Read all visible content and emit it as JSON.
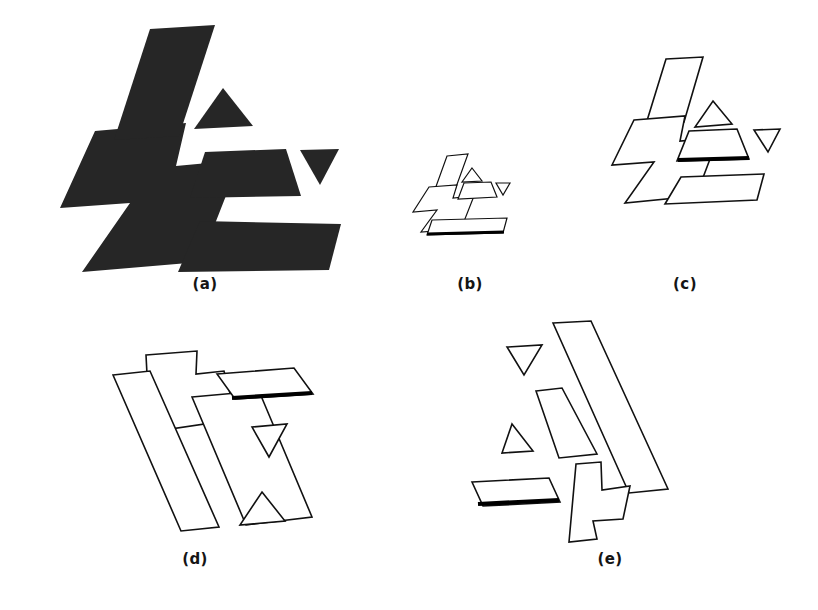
{
  "figure": {
    "background_color": "#ffffff",
    "silhouette_color": "#262626",
    "outline_color": "#111111",
    "emphasis_color": "#000000",
    "panel_count": 5
  },
  "captions": {
    "a": "(a)",
    "b": "(b)",
    "c": "(c)",
    "d": "(d)",
    "e": "(e)"
  },
  "panels": [
    {
      "id": "a",
      "label": "(a)",
      "kind": "filled-silhouette",
      "description": "Scene silhouette: large zigzag polygon, slanted bar, trapezoid, up triangle, down triangle",
      "part_count": 5
    },
    {
      "id": "b",
      "label": "(b)",
      "kind": "wireframe",
      "description": "Small scale model outline hypothesis with highlighted base edge",
      "part_count": 6
    },
    {
      "id": "c",
      "label": "(c)",
      "kind": "wireframe",
      "description": "Model outline hypothesis, upright pose, highlighted trapezoid base edge",
      "part_count": 6
    },
    {
      "id": "d",
      "label": "(d)",
      "kind": "wireframe",
      "description": "Model outline hypothesis, rotated pose, highlighted slanted bar base edge",
      "part_count": 6
    },
    {
      "id": "e",
      "label": "(e)",
      "kind": "wireframe",
      "description": "Model outline hypothesis, mirrored rotated pose, highlighted parallelogram base edge",
      "part_count": 6
    }
  ],
  "shapes": {
    "a": {
      "zigzag": "95,131 185,124 175,166 239,160 200,260 82,271 128,203 61,207",
      "slanted_bar": "150,30 214,26 178,135 113,139",
      "trapezoid": "205,152 285,149 300,196 190,197",
      "triangle_up": "222,89 252,125 194,128",
      "triangle_down": "300,152 338,151 319,184",
      "big_bottom": "199,221 340,225 328,269 178,271"
    },
    "b": {
      "zigzag": "428,188 456,186 452,199 473,197 460,228 422,231 436,209 414,211",
      "slanted_bar": "447,156 467,155 455,190 434,191",
      "trapezoid": "464,184 490,183 495,198 459,199",
      "triangle_up": "471,169 481,181 462,182",
      "triangle_down": "496,184 509,184 502,195",
      "base_bar": "424,228 499,228 503,234 428,234",
      "heavy_edge": "425,234 503,234"
    },
    "c": {
      "zigzag": "633,120 683,117 678,141 716,138 694,195 626,201 653,162 614,164",
      "slanted_bar": "665,62 701,60 683,122 646,124",
      "trapezoid": "689,132 736,131 747,159 678,160",
      "triangle_up": "712,103 730,124 696,126",
      "triangle_down": "755,131 779,130 767,152",
      "base_bar": "680,182 762,178 756,200 666,203",
      "heavy_edge": "680,160 748,160"
    },
    "d": {
      "zigzag": "154,357 196,352 196,373 225,370 231,397 195,401 203,424 150,432",
      "slanted_bar": "193,398 258,392 311,518 246,527",
      "trapezoid": "230,376 311,369 332,399 254,403",
      "triangle_up": "262,494 283,520 241,524",
      "triangle_down": "254,428 286,425 269,456",
      "base_bar": "115,375 150,372 217,528 180,530",
      "heavy_edge": "232,399 331,397"
    },
    "e": {
      "zigzag": "576,465 600,463 601,489 628,485 622,517 592,520 595,537 570,540",
      "slanted_bar": "552,325 589,323 624,490 586,493",
      "trapezoid": "537,392 561,389 595,453 559,457",
      "triangle_up": "512,425 531,450 503,452",
      "triangle_down": "507,348 541,346 524,374",
      "base_bar": "473,483 548,479 558,503 482,506",
      "heavy_edge": "477,503 557,500"
    }
  }
}
